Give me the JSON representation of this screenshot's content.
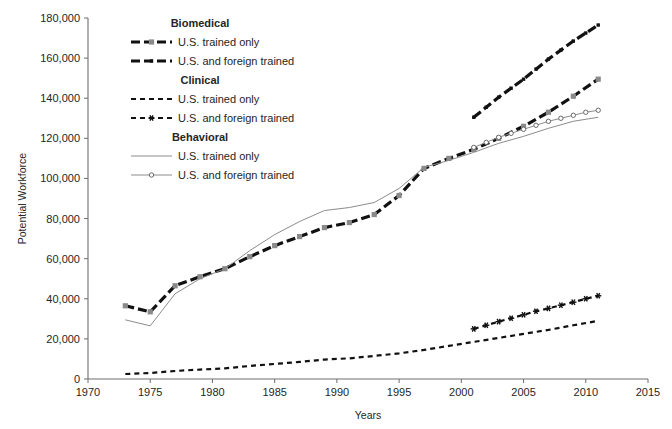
{
  "chart": {
    "type": "line",
    "title": "",
    "xlabel": "Years",
    "ylabel": "Potential Workforce",
    "xlim": [
      1970,
      2015
    ],
    "ylim": [
      0,
      180000
    ],
    "xticks": [
      "1970",
      "1975",
      "1980",
      "1985",
      "1990",
      "1995",
      "2000",
      "2005",
      "2010",
      "2015"
    ],
    "yticks": [
      "0",
      "20,000",
      "40,000",
      "60,000",
      "80,000",
      "100,000",
      "120,000",
      "140,000",
      "160,000",
      "180,000"
    ],
    "grid": false,
    "legend_position": "upper-left-inside"
  },
  "legend": {
    "groups": [
      {
        "heading": "Biomedical",
        "items": [
          {
            "label": "U.S. trained only",
            "style": "dashed-thick-black",
            "marker": "square-gray"
          },
          {
            "label": "U.S. and foreign trained",
            "style": "dashed-thick-black",
            "marker": "square-black-small"
          }
        ]
      },
      {
        "heading": "Clinical",
        "items": [
          {
            "label": "U.S. trained only",
            "style": "dashed-thin-black",
            "marker": "none"
          },
          {
            "label": "U.S. and foreign trained",
            "style": "dashed-thin-black",
            "marker": "asterisk-black"
          }
        ]
      },
      {
        "heading": "Behavioral",
        "items": [
          {
            "label": "U.S. trained only",
            "style": "solid-thin-gray",
            "marker": "none"
          },
          {
            "label": "U.S. and foreign trained",
            "style": "solid-thin-gray",
            "marker": "circle-open"
          }
        ]
      }
    ]
  },
  "chart_data": {
    "type": "line",
    "title": "",
    "xlabel": "Years",
    "ylabel": "Potential Workforce",
    "xlim": [
      1970,
      2015
    ],
    "ylim": [
      0,
      180000
    ],
    "xticks": [
      1970,
      1975,
      1980,
      1985,
      1990,
      1995,
      2000,
      2005,
      2010,
      2015
    ],
    "yticks": [
      0,
      20000,
      40000,
      60000,
      80000,
      100000,
      120000,
      140000,
      160000,
      180000
    ],
    "grid": false,
    "legend": [
      "Biomedical - U.S. trained only",
      "Biomedical - U.S. and foreign trained",
      "Clinical - U.S. trained only",
      "Clinical - U.S. and foreign trained",
      "Behavioral - U.S. trained only",
      "Behavioral - U.S. and foreign trained"
    ],
    "series": [
      {
        "name": "Biomedical - U.S. trained only",
        "color": "#111111",
        "style": "dashed-thick",
        "marker": "square-gray",
        "x": [
          1973,
          1975,
          1977,
          1979,
          1981,
          1983,
          1985,
          1987,
          1989,
          1991,
          1993,
          1995,
          1997,
          1999,
          2001,
          2003,
          2005,
          2007,
          2009,
          2011
        ],
        "y": [
          36500,
          33500,
          46500,
          51000,
          55000,
          61000,
          66500,
          71000,
          75500,
          78000,
          82000,
          91500,
          105000,
          110000,
          114500,
          120000,
          126000,
          133000,
          141000,
          149500
        ]
      },
      {
        "name": "Biomedical - U.S. and foreign trained",
        "color": "#111111",
        "style": "dashed-thick",
        "marker": "square-black-small",
        "x": [
          2001,
          2002,
          2003,
          2004,
          2005,
          2006,
          2007,
          2008,
          2009,
          2010,
          2011
        ],
        "y": [
          130500,
          135500,
          140500,
          145000,
          149500,
          154500,
          159500,
          164000,
          168500,
          172500,
          176500
        ]
      },
      {
        "name": "Clinical - U.S. trained only",
        "color": "#111111",
        "style": "dashed-thin",
        "marker": "none",
        "x": [
          1973,
          1975,
          1977,
          1979,
          1981,
          1983,
          1985,
          1987,
          1989,
          1991,
          1993,
          1995,
          1997,
          1999,
          2001,
          2003,
          2005,
          2007,
          2009,
          2011
        ],
        "y": [
          2500,
          3000,
          4000,
          4700,
          5300,
          6500,
          7500,
          8500,
          9700,
          10300,
          11500,
          12800,
          14500,
          16500,
          18500,
          20500,
          22500,
          24500,
          26800,
          29000
        ]
      },
      {
        "name": "Clinical - U.S. and foreign trained",
        "color": "#111111",
        "style": "dashed-thin",
        "marker": "asterisk-black",
        "x": [
          2001,
          2002,
          2003,
          2004,
          2005,
          2006,
          2007,
          2008,
          2009,
          2010,
          2011
        ],
        "y": [
          25000,
          26800,
          28600,
          30300,
          32000,
          33800,
          35200,
          36800,
          38300,
          40000,
          41500
        ]
      },
      {
        "name": "Behavioral - U.S. trained only",
        "color": "#8c8c8c",
        "style": "solid-thin",
        "marker": "none",
        "x": [
          1973,
          1975,
          1977,
          1979,
          1981,
          1983,
          1985,
          1987,
          1989,
          1991,
          1993,
          1995,
          1997,
          1999,
          2001,
          2003,
          2005,
          2007,
          2009,
          2011
        ],
        "y": [
          29500,
          26500,
          42500,
          50000,
          55000,
          64000,
          72000,
          78500,
          84000,
          85500,
          88000,
          95000,
          105500,
          109000,
          113000,
          117500,
          121000,
          125000,
          128500,
          130500
        ]
      },
      {
        "name": "Behavioral - U.S. and foreign trained",
        "color": "#8c8c8c",
        "style": "solid-thin",
        "marker": "circle-open",
        "x": [
          2001,
          2002,
          2003,
          2004,
          2005,
          2006,
          2007,
          2008,
          2009,
          2010,
          2011
        ],
        "y": [
          115500,
          118000,
          120500,
          122500,
          124500,
          126500,
          128500,
          130000,
          131500,
          133000,
          134000
        ]
      }
    ]
  }
}
